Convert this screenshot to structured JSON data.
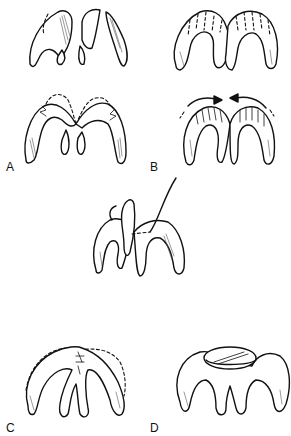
{
  "figure": {
    "panels": [
      {
        "id": "A",
        "label": "A",
        "description": "Cartilage incised and sutured with dashed outline of original shape (two stages)"
      },
      {
        "id": "B",
        "label": "B",
        "description": "Scored cartilage (dotted lines) then bent inward with arrows"
      },
      {
        "id": "center",
        "label": "",
        "description": "Suture being placed through medial crura"
      },
      {
        "id": "C",
        "label": "C",
        "description": "Domes sutured together with dashed original contour"
      },
      {
        "id": "D",
        "label": "D",
        "description": "Graft placed on top of the domes"
      }
    ],
    "colors": {
      "line": "#111111",
      "background": "#ffffff"
    }
  }
}
